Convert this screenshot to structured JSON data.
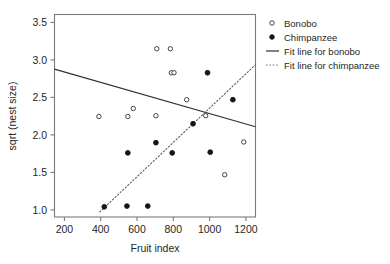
{
  "chart_data": {
    "type": "scatter",
    "title": "",
    "xlabel": "Fruit index",
    "ylabel": "sqrt (nest size)",
    "xlim": [
      140,
      1250
    ],
    "ylim": [
      0.86,
      3.64
    ],
    "grid": false,
    "legend_position": "right",
    "xticks": [
      200,
      400,
      600,
      800,
      1000,
      1200
    ],
    "xtick_labels": [
      "200",
      "400",
      "600",
      "800",
      "1000",
      "1200"
    ],
    "yticks": [
      1.0,
      1.5,
      2.0,
      2.5,
      3.0,
      3.5
    ],
    "ytick_labels": [
      "1.0",
      "1.5",
      "2.0",
      "2.5",
      "3.0",
      "3.5"
    ],
    "series": [
      {
        "name": "Bonobo",
        "marker": "open-circle",
        "color": "#303030",
        "points": [
          [
            385,
            2.24
          ],
          [
            545,
            2.24
          ],
          [
            575,
            2.35
          ],
          [
            700,
            2.25
          ],
          [
            705,
            3.17
          ],
          [
            780,
            3.17
          ],
          [
            785,
            2.84
          ],
          [
            800,
            2.84
          ],
          [
            870,
            2.47
          ],
          [
            975,
            2.25
          ],
          [
            1080,
            1.44
          ],
          [
            1185,
            1.89
          ]
        ]
      },
      {
        "name": "Chimpanzee",
        "marker": "filled-circle",
        "color": "#151515",
        "points": [
          [
            415,
            1.0
          ],
          [
            540,
            1.01
          ],
          [
            545,
            1.74
          ],
          [
            655,
            1.01
          ],
          [
            700,
            1.88
          ],
          [
            790,
            1.74
          ],
          [
            905,
            2.14
          ],
          [
            985,
            2.84
          ],
          [
            1000,
            1.75
          ],
          [
            1125,
            2.47
          ]
        ]
      }
    ],
    "fit_lines": [
      {
        "name": "Fit line for bonobo",
        "style": "solid",
        "color": "#303030",
        "x0": 140,
        "y0": 2.89,
        "x1": 1250,
        "y1": 2.1
      },
      {
        "name": "Fit line for chimpanzee",
        "style": "dotted",
        "color": "#5a5a5a",
        "x0": 390,
        "y0": 0.93,
        "x1": 1250,
        "y1": 2.95
      }
    ]
  },
  "legend": {
    "entries": [
      {
        "label": "Bonobo",
        "marker": "open-circle"
      },
      {
        "label": "Chimpanzee",
        "marker": "filled-circle"
      },
      {
        "label": "Fit line for bonobo",
        "marker": "solid-line"
      },
      {
        "label": "Fit line for chimpanzee",
        "marker": "dotted-line"
      }
    ]
  }
}
